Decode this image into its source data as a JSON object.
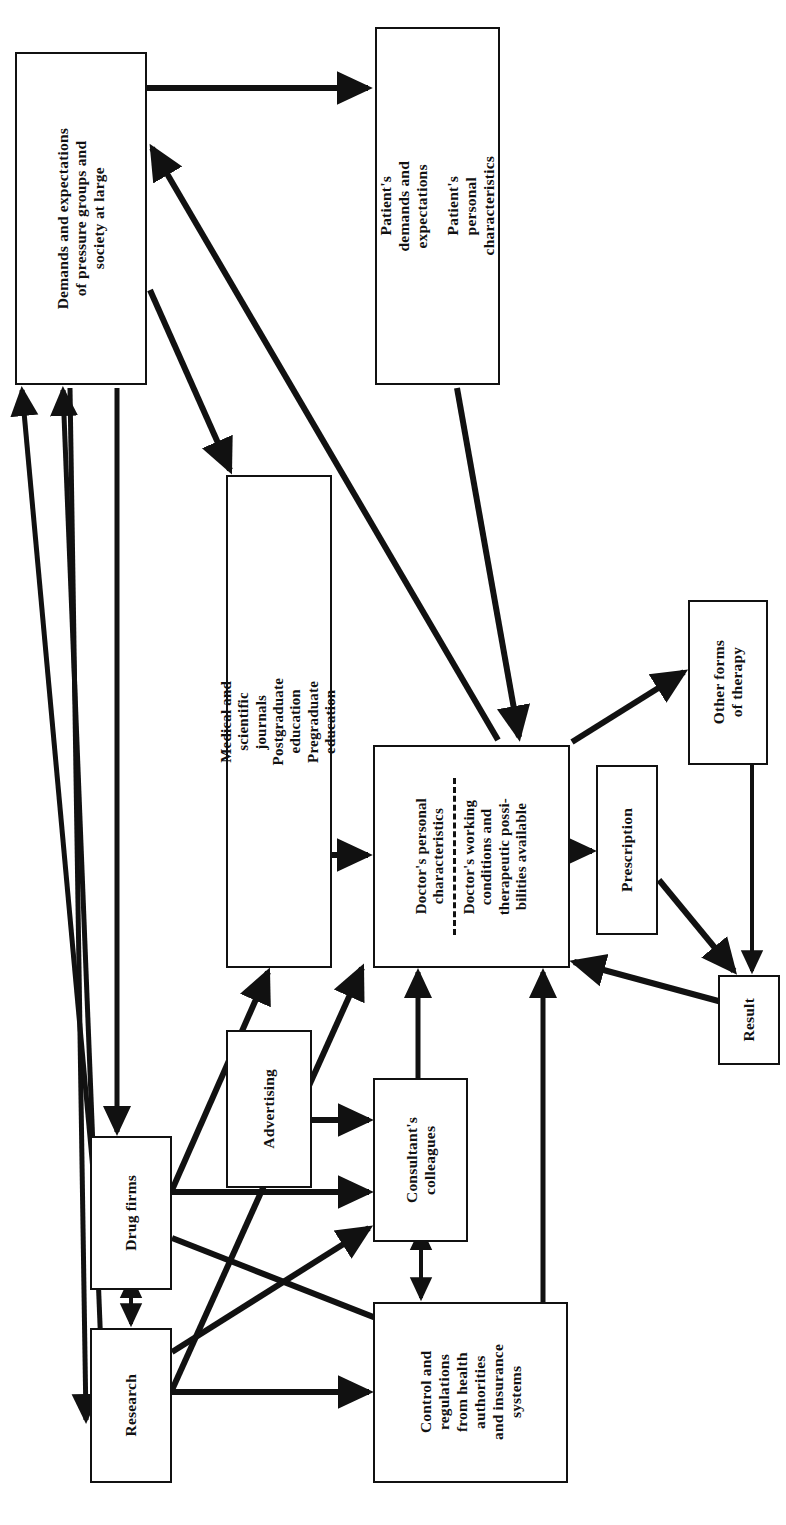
{
  "diagram": {
    "orientation": "rotated-90-ccw",
    "ink_color": "#111111",
    "background_color": "#ffffff",
    "nodes": [
      {
        "id": "demands",
        "name": "demands-and-expectations-box",
        "lines": [
          "Demands and expectations",
          "of pressure groups and",
          "society at large"
        ],
        "x": 15,
        "y": 52,
        "w": 132,
        "h": 333
      },
      {
        "id": "patient",
        "name": "patient-box",
        "groups": [
          [
            "Patient's",
            "demands and",
            "expectations"
          ],
          [
            "Patient's",
            "personal",
            "characteristics"
          ]
        ],
        "x": 375,
        "y": 27,
        "w": 125,
        "h": 358
      },
      {
        "id": "education",
        "name": "education-and-journals-box",
        "groups": [
          [
            "Medical and",
            "scientific",
            "journals"
          ],
          [
            "Postgraduate",
            "education"
          ],
          [
            "Pregraduate",
            "education"
          ]
        ],
        "x": 226,
        "y": 475,
        "w": 106,
        "h": 493
      },
      {
        "id": "doctor",
        "name": "doctor-box",
        "groups": [
          [
            "Doctor's personal",
            "characteristics"
          ],
          [
            "Doctor's working",
            "conditions and",
            "therapeutic possi-",
            "bilities available"
          ]
        ],
        "divider": "dashed",
        "x": 373,
        "y": 745,
        "w": 197,
        "h": 223
      },
      {
        "id": "other_therapy",
        "name": "other-forms-of-therapy-box",
        "lines": [
          "Other forms",
          "of therapy"
        ],
        "x": 688,
        "y": 600,
        "w": 80,
        "h": 165
      },
      {
        "id": "prescription",
        "name": "prescription-box",
        "lines": [
          "Prescription"
        ],
        "x": 596,
        "y": 765,
        "w": 62,
        "h": 170
      },
      {
        "id": "result",
        "name": "result-box",
        "lines": [
          "Result"
        ],
        "x": 718,
        "y": 975,
        "w": 62,
        "h": 90
      },
      {
        "id": "advertising",
        "name": "advertising-box",
        "lines": [
          "Advertising"
        ],
        "x": 226,
        "y": 1030,
        "w": 86,
        "h": 158
      },
      {
        "id": "consultants",
        "name": "consultants-colleagues-box",
        "lines": [
          "Consultant's",
          "colleagues"
        ],
        "x": 373,
        "y": 1078,
        "w": 95,
        "h": 164
      },
      {
        "id": "drug_firms",
        "name": "drug-firms-box",
        "lines": [
          "Drug firms"
        ],
        "x": 90,
        "y": 1136,
        "w": 82,
        "h": 154
      },
      {
        "id": "research",
        "name": "research-box",
        "lines": [
          "Research"
        ],
        "x": 90,
        "y": 1328,
        "w": 82,
        "h": 155
      },
      {
        "id": "control",
        "name": "control-and-regulations-box",
        "lines": [
          "Control and",
          "regulations",
          "from health",
          "authorities",
          "and insurance",
          "systems"
        ],
        "x": 373,
        "y": 1302,
        "w": 195,
        "h": 181
      }
    ],
    "edges": [
      {
        "from": "demands",
        "to": "patient",
        "style": "arrow"
      },
      {
        "from": "patient",
        "to": "doctor",
        "style": "arrow"
      },
      {
        "from": "demands",
        "to": "education",
        "style": "arrow"
      },
      {
        "from": "doctor",
        "to": "demands",
        "style": "arrow"
      },
      {
        "from": "education",
        "to": "doctor",
        "style": "arrow"
      },
      {
        "from": "doctor",
        "to": "prescription",
        "style": "arrow"
      },
      {
        "from": "doctor",
        "to": "other_therapy",
        "style": "arrow"
      },
      {
        "from": "prescription",
        "to": "result",
        "style": "arrow"
      },
      {
        "from": "other_therapy",
        "to": "result",
        "style": "arrow"
      },
      {
        "from": "result",
        "to": "doctor",
        "style": "arrow"
      },
      {
        "from": "advertising",
        "to": "consultants",
        "style": "arrow"
      },
      {
        "from": "consultants",
        "to": "doctor",
        "style": "arrow"
      },
      {
        "from": "drug_firms",
        "to": "education",
        "style": "arrow"
      },
      {
        "from": "drug_firms",
        "to": "consultants",
        "style": "arrow"
      },
      {
        "from": "drug_firms",
        "to": "control",
        "style": "arrow"
      },
      {
        "from": "research",
        "to": "education",
        "style": "arrow"
      },
      {
        "from": "research",
        "to": "consultants",
        "style": "arrow"
      },
      {
        "from": "research",
        "to": "control",
        "style": "arrow"
      },
      {
        "from": "drug_firms",
        "to": "research",
        "style": "double-arrow"
      },
      {
        "from": "consultants",
        "to": "control",
        "style": "double-arrow"
      },
      {
        "from": "control",
        "to": "doctor",
        "style": "arrow"
      },
      {
        "from": "drug_firms",
        "to": "demands",
        "style": "arrow"
      },
      {
        "from": "research",
        "to": "demands",
        "style": "arrow"
      },
      {
        "from": "demands",
        "to": "drug_firms",
        "style": "arrow"
      },
      {
        "from": "demands",
        "to": "research",
        "style": "arrow"
      }
    ]
  }
}
